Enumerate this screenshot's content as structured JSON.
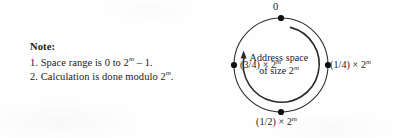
{
  "figure": {
    "type": "ring-diagram",
    "title_text": "",
    "note": {
      "heading": "Note:",
      "items": [
        {
          "prefix": "1. Space range is 0 to 2",
          "exponent": "m",
          "suffix": " – 1."
        },
        {
          "prefix": "2. Calculation is done modulo 2",
          "exponent": "m",
          "suffix": "."
        }
      ]
    },
    "ring": {
      "center_caption_line1": "Address space",
      "center_caption_line2_prefix": "of size 2",
      "center_caption_line2_exponent": "m",
      "nodes": [
        {
          "id": "top",
          "label_prefix": "0",
          "exponent": "",
          "label_suffix": "",
          "angle_deg": 0,
          "position": "top"
        },
        {
          "id": "right",
          "label_prefix": "(1/4) × 2",
          "exponent": "m",
          "label_suffix": "",
          "angle_deg": 90,
          "position": "right"
        },
        {
          "id": "bottom",
          "label_prefix": "(1/2) × 2",
          "exponent": "m",
          "label_suffix": "",
          "angle_deg": 180,
          "position": "bottom"
        },
        {
          "id": "left",
          "label_prefix": "(3/4) × 2",
          "exponent": "m",
          "label_suffix": "",
          "angle_deg": 270,
          "position": "left"
        }
      ],
      "direction_arrow": {
        "description": "clockwise-inner-arc-arrow",
        "starts_near": "top",
        "ends_near": "left",
        "sweep": "clockwise"
      },
      "geometry": {
        "center_x": 85,
        "center_y": 65,
        "outer_radius": 47,
        "inner_arc_radius": 38,
        "node_dot_radius": 3
      }
    },
    "colors": {
      "ink": "#1a1a1a",
      "paper": "#fefefe",
      "stroke": "#2b2b2b"
    }
  }
}
